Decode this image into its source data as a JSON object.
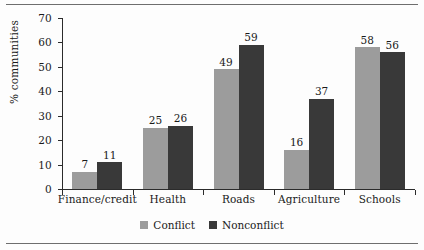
{
  "chart_data": {
    "type": "bar",
    "title": "",
    "subtitle": "",
    "xlabel": "",
    "ylabel": "% communities",
    "ylim": [
      0,
      70
    ],
    "ytick_step": 10,
    "yticks": [
      0,
      10,
      20,
      30,
      40,
      50,
      60,
      70
    ],
    "grid": false,
    "legend_position": "bottom-center",
    "orientation": "vertical",
    "grouping": "grouped",
    "data_labels": true,
    "categories": [
      "Finance/credit",
      "Health",
      "Roads",
      "Agriculture",
      "Schools"
    ],
    "series": [
      {
        "name": "Conflict",
        "color": "#9c9c9c",
        "values": [
          7,
          25,
          49,
          16,
          58
        ]
      },
      {
        "name": "Nonconflict",
        "color": "#393939",
        "values": [
          11,
          26,
          59,
          37,
          56
        ]
      }
    ],
    "annotations": []
  },
  "figure": {
    "background": "#fdfdfd",
    "rule_color": "#6e6e6e",
    "axis_color": "#2b2b2b"
  }
}
